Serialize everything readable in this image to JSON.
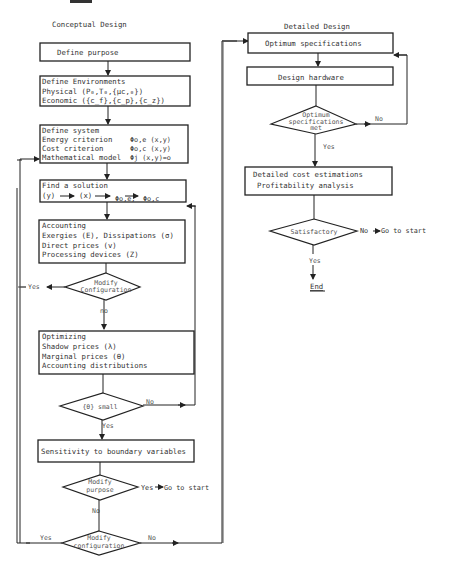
{
  "figure": {
    "corner_mark": "",
    "colors": {
      "line": "#222222",
      "text": "#333333",
      "background": "#ffffff"
    }
  },
  "conceptual": {
    "heading": "Conceptual Design",
    "define_purpose": "Define purpose",
    "environments": {
      "title": "Define Environments",
      "physical": "Physical (P₀,T₀,{μc,₀})",
      "economic": "Economic ({c_f},{c_p},{c_z})"
    },
    "system": {
      "title": "Define system",
      "energy_label": "Energy criterion",
      "energy_expr": "Φo,e (x,y)",
      "cost_label": "Cost criterion",
      "cost_expr": "Φo,c (x,y)",
      "math_label": "Mathematical model",
      "math_expr": "Φj (x,y)=o"
    },
    "solution": {
      "title": "Find a solution",
      "chain": [
        "(y)",
        "(x)",
        "Φo,e,",
        "Φo,c"
      ]
    },
    "accounting": {
      "title": "Accounting",
      "line1": "Exergies (E),  Dissipations (σ)",
      "line2": "Direct prices (v)",
      "line3": "Processing devices (Z)"
    },
    "modify_config_1": {
      "line1": "Modify",
      "line2": "Configuration",
      "yes": "Yes",
      "no": "no"
    },
    "optimizing": {
      "title": "Optimizing",
      "line1": "Shadow prices   (λ)",
      "line2": "Marginal prices (θ)",
      "line3": "Accounting distributions"
    },
    "theta_small": {
      "label": "{θ} small",
      "no": "No",
      "yes": "Yes"
    },
    "sensitivity": "Sensitivity to boundary variables",
    "modify_purpose": {
      "line1": "Modify",
      "line2": "purpose",
      "yes": "Yes",
      "go": "Go to start",
      "no": "No"
    },
    "modify_config_2": {
      "line1": "Modify",
      "line2": "configuration",
      "yes": "Yes",
      "no": "No"
    }
  },
  "detailed": {
    "heading": "Detailed Design",
    "optimum_specs": "Optimum specifications",
    "design_hardware": "Design hardware",
    "specs_met": {
      "line1": "Optimum",
      "line2": "specifications",
      "line3": "met",
      "no": "No",
      "yes": "Yes"
    },
    "cost": {
      "line1": "Detailed cost estimations",
      "line2": "Profitability analysis"
    },
    "satisfactory": {
      "label": "Satisfactory",
      "no": "No",
      "go": "Go to start",
      "yes": "Yes"
    },
    "end": "End"
  }
}
